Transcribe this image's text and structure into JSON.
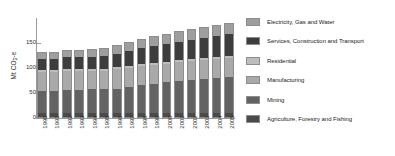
{
  "chart_data": {
    "type": "bar",
    "stacked": true,
    "title": "",
    "xlabel": "",
    "ylabel": "Mt CO2-e",
    "ylim": [
      0,
      200
    ],
    "yticks": [
      0,
      50,
      100,
      150
    ],
    "ytick_labels": [
      "0",
      "50",
      "100",
      "150"
    ],
    "grid": false,
    "legend_position": "right",
    "categories": [
      "1990",
      "1991",
      "1992",
      "1993",
      "1994",
      "1995",
      "1996",
      "1997",
      "1998",
      "1999",
      "2000",
      "2001",
      "2002",
      "2003",
      "2004",
      "2005"
    ],
    "series": [
      {
        "name": "Agriculture, Forestry and Fishing",
        "color": "#4a4a4a",
        "values": [
          9,
          9,
          9,
          9,
          9,
          9,
          9,
          9,
          9,
          9,
          9,
          9,
          9,
          9,
          9,
          9
        ]
      },
      {
        "name": "Mining",
        "color": "#636363",
        "values": [
          45,
          45,
          47,
          47,
          48,
          48,
          49,
          52,
          56,
          59,
          62,
          65,
          66,
          68,
          70,
          72
        ]
      },
      {
        "name": "Manufacturing",
        "color": "#a9a9a9",
        "values": [
          39,
          39,
          39,
          39,
          38,
          38,
          40,
          40,
          39,
          38,
          38,
          38,
          39,
          39,
          40,
          40
        ]
      },
      {
        "name": "Residential",
        "color": "#bdbdbd",
        "values": [
          4,
          4,
          4,
          4,
          4,
          4,
          4,
          4,
          4,
          4,
          4,
          4,
          4,
          4,
          4,
          4
        ]
      },
      {
        "name": "Services, Construction and Transport",
        "color": "#3d3d3d",
        "values": [
          23,
          23,
          24,
          24,
          25,
          27,
          28,
          30,
          33,
          35,
          36,
          38,
          39,
          41,
          42,
          44
        ]
      },
      {
        "name": "Electricity, Gas and Water",
        "color": "#9e9e9e",
        "values": [
          12,
          12,
          13,
          13,
          14,
          15,
          16,
          17,
          18,
          19,
          20,
          20,
          21,
          21,
          22,
          22
        ]
      }
    ],
    "totals": [
      132,
      132,
      136,
      136,
      138,
      141,
      146,
      152,
      159,
      164,
      169,
      174,
      178,
      182,
      187,
      191
    ]
  },
  "legend": {
    "items": [
      {
        "label": "Electricity, Gas and Water",
        "color": "#9e9e9e"
      },
      {
        "label": "Services, Construction and Transport",
        "color": "#3d3d3d"
      },
      {
        "label": "Residential",
        "color": "#bdbdbd"
      },
      {
        "label": "Manufacturing",
        "color": "#a9a9a9"
      },
      {
        "label": "Mining",
        "color": "#636363"
      },
      {
        "label": "Agriculture, Forestry and Fishing",
        "color": "#4a4a4a"
      }
    ]
  },
  "axis": {
    "y_label_main": "Mt CO",
    "y_label_sub": "2",
    "y_label_tail": "-e"
  }
}
